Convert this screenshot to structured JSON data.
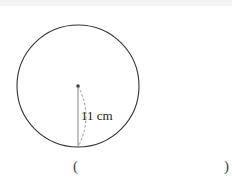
{
  "figure": {
    "shape": "circle",
    "radius_label": "11 cm",
    "radius_value": 11,
    "unit": "cm"
  },
  "answer_blank": {
    "open": "(",
    "close": ")"
  }
}
